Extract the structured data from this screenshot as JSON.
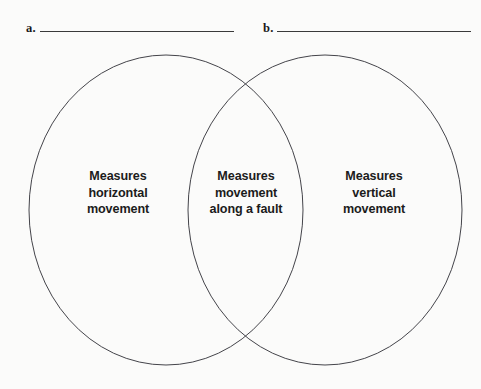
{
  "worksheet": {
    "blanks": [
      {
        "label": "a.",
        "value": ""
      },
      {
        "label": "b.",
        "value": ""
      }
    ]
  },
  "venn": {
    "left_region": {
      "lines": [
        "Measures",
        "horizontal",
        "movement"
      ]
    },
    "center_region": {
      "lines": [
        "Measures",
        "movement",
        "along a fault"
      ]
    },
    "right_region": {
      "lines": [
        "Measures",
        "vertical",
        "movement"
      ]
    },
    "colors": {
      "background": "#fbfbfa",
      "stroke": "#44444a",
      "text": "#1c1c1c",
      "rule": "#3a3a3a"
    }
  }
}
